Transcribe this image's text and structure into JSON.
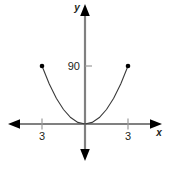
{
  "figure": {
    "background_color": "#ffffff",
    "axis_color": "#808080",
    "arrow_color": "#000000",
    "curve_color": "#3a3a3a",
    "point_color": "#000000",
    "text_color": "#231f20",
    "width": 169,
    "height": 169
  },
  "axes": {
    "x_label": "x",
    "y_label": "y",
    "origin_px": {
      "x": 85,
      "y": 124
    }
  },
  "chart_data": {
    "type": "line",
    "title": "",
    "xlabel": "x",
    "ylabel": "y",
    "grid": false,
    "legend": "none",
    "xlim": [
      -4.6,
      4.6
    ],
    "ylim": [
      -30,
      160
    ],
    "xticks": [
      -3,
      3
    ],
    "xticklabels": [
      "3",
      "3"
    ],
    "yticks": [
      90
    ],
    "yticklabels": [
      "90"
    ],
    "series": [
      {
        "name": "parabola",
        "shape": "upward-parabola",
        "vertex": [
          0,
          0
        ],
        "endpoints": [
          [
            -3,
            90
          ],
          [
            3,
            90
          ]
        ],
        "endpoints_marked": true,
        "x": [
          -3,
          -2.5,
          -2,
          -1.5,
          -1,
          -0.5,
          0,
          0.5,
          1,
          1.5,
          2,
          2.5,
          3
        ],
        "y": [
          90,
          62.5,
          40,
          22.5,
          10,
          2.5,
          0,
          2.5,
          10,
          22.5,
          40,
          62.5,
          90
        ],
        "equation": "y = 10x^2"
      }
    ]
  },
  "labels": {
    "x_tick_left": "3",
    "x_tick_right": "3",
    "y_tick_90": "90"
  }
}
